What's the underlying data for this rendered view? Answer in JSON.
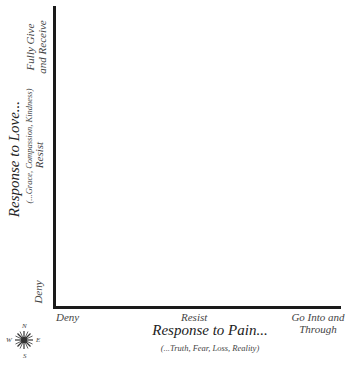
{
  "diagram": {
    "x_axis": {
      "title": "Response to Pain...",
      "subtitle": "(...Truth, Fear, Loss, Reality)",
      "ticks": [
        "Deny",
        "Resist",
        "Go Into and",
        "Through"
      ]
    },
    "y_axis": {
      "title": "Response to Love...",
      "subtitle": "(...Grace, Compassion, Kindness)",
      "ticks": [
        "Deny",
        "Resist",
        "Fully Give",
        "and Receive"
      ]
    },
    "compass": {
      "n": "N",
      "s": "S",
      "e": "E",
      "w": "W"
    },
    "colors": {
      "axis": "#1a1a1a",
      "text": "#333333"
    }
  }
}
